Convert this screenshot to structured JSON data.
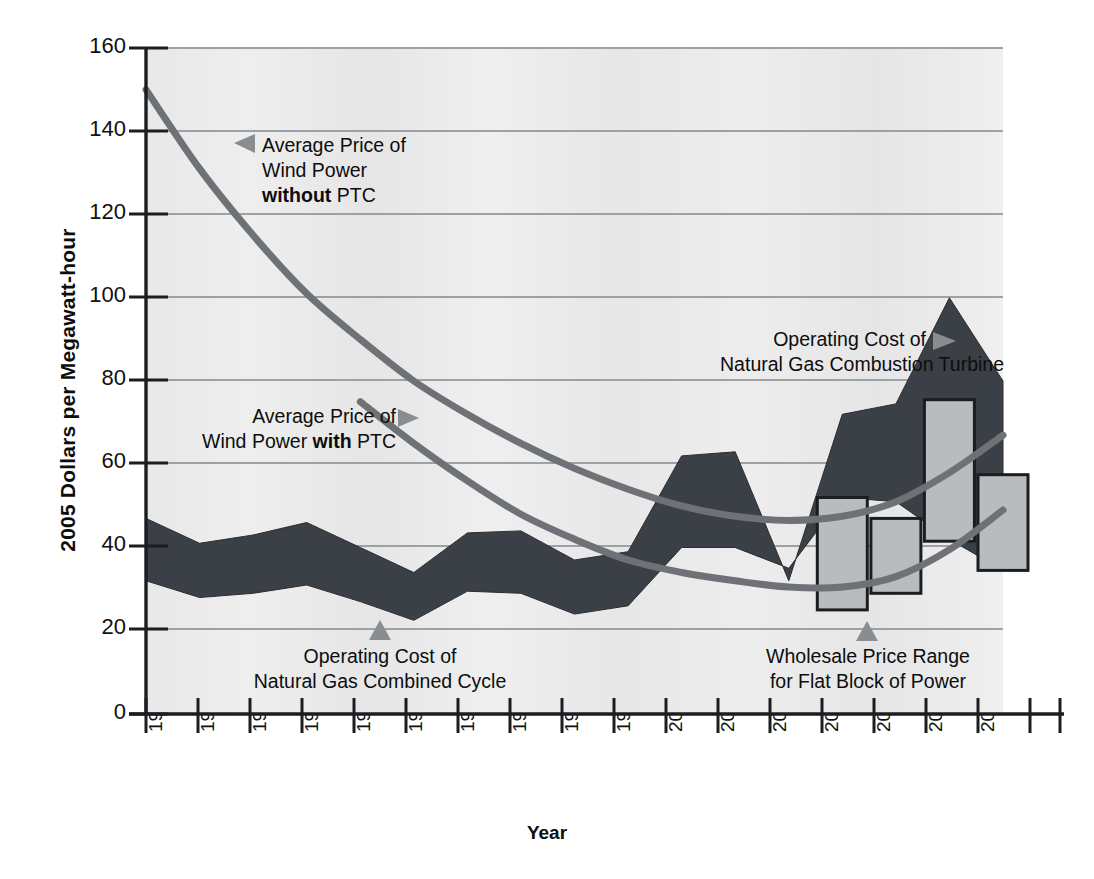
{
  "chart_data": {
    "type": "area",
    "title": "",
    "xlabel": "Year",
    "ylabel": "2005 Dollars per Megawatt-hour",
    "xlim": [
      1990,
      2006
    ],
    "ylim": [
      0,
      160
    ],
    "yticks": [
      0,
      20,
      40,
      60,
      80,
      100,
      120,
      140,
      160
    ],
    "categories": [
      "1990",
      "1991",
      "1992",
      "1993",
      "1994",
      "1995",
      "1996",
      "1997",
      "1998",
      "1999",
      "2000",
      "2001",
      "2002",
      "2003",
      "2004",
      "2005",
      "2006"
    ],
    "grid": true,
    "legend": "annotations",
    "series": [
      {
        "name": "Operating Cost of Natural Gas Combined Cycle / Combustion Turbine",
        "type": "band",
        "color": "#3b3f46",
        "upper": [
          47,
          41,
          43,
          46,
          40,
          34,
          43.5,
          44,
          37,
          39,
          62,
          63,
          32,
          72,
          74.5,
          100,
          80
        ],
        "lower": [
          32,
          28,
          29,
          31,
          27,
          22.5,
          29.5,
          29,
          24,
          26,
          40,
          40,
          35,
          52,
          51,
          42,
          34.5
        ]
      },
      {
        "name": "Average Price of Wind Power without PTC",
        "type": "line",
        "color": "#6e7277",
        "x": [
          1990,
          1991,
          1992,
          1993,
          1994,
          1995,
          1996,
          1997,
          1998,
          1999,
          2000,
          2001,
          2002,
          2003,
          2004,
          2005,
          2006
        ],
        "y": [
          150,
          131,
          115,
          101,
          90,
          80,
          72,
          65,
          59,
          54,
          50,
          47.5,
          46.5,
          47.5,
          51,
          58,
          67
        ]
      },
      {
        "name": "Average Price of Wind Power with PTC",
        "type": "line",
        "color": "#6e7277",
        "x": [
          1994,
          1995,
          1996,
          1997,
          1998,
          1999,
          2000,
          2001,
          2002,
          2003,
          2004,
          2005,
          2006
        ],
        "y": [
          75,
          65,
          56,
          48,
          42,
          37,
          34,
          32,
          30.5,
          30.5,
          33,
          39.5,
          49
        ]
      },
      {
        "name": "Wholesale Price Range for Flat Block of Power",
        "type": "range-bar",
        "color": "#b9bcbe",
        "years": [
          2003,
          2004,
          2005,
          2006
        ],
        "high": [
          52,
          47,
          75.5,
          57.5
        ],
        "low": [
          25,
          29,
          41.5,
          34.5
        ]
      }
    ],
    "annotations": [
      {
        "id": "wind-without-ptc",
        "line1": "Average Price of",
        "line2": "Wind Power",
        "line3_bold": "without",
        "line3_rest": " PTC",
        "marker": "left-triangle"
      },
      {
        "id": "wind-with-ptc",
        "line1": "Average Price of",
        "line2_rest_a": "Wind Power ",
        "line2_bold": "with",
        "line2_rest_b": " PTC",
        "marker": "right-triangle"
      },
      {
        "id": "combustion-turbine",
        "line1": "Operating Cost of",
        "line2": "Natural Gas Combustion Turbine",
        "marker": "right-triangle"
      },
      {
        "id": "combined-cycle",
        "line1": "Operating Cost of",
        "line2": "Natural Gas Combined Cycle",
        "marker": "up-triangle"
      },
      {
        "id": "wholesale-range",
        "line1": "Wholesale Price Range",
        "line2": "for Flat Block of Power",
        "marker": "up-triangle"
      }
    ],
    "colors": {
      "band": "#3b3f46",
      "wind_line": "#6e7277",
      "bar_fill": "#b9bcbe",
      "bar_stroke": "#1b1d20",
      "gridline": "#9a9ea1",
      "axis": "#1b1d20",
      "plot_background": "#ececec",
      "marker": "#8a8d90"
    }
  }
}
